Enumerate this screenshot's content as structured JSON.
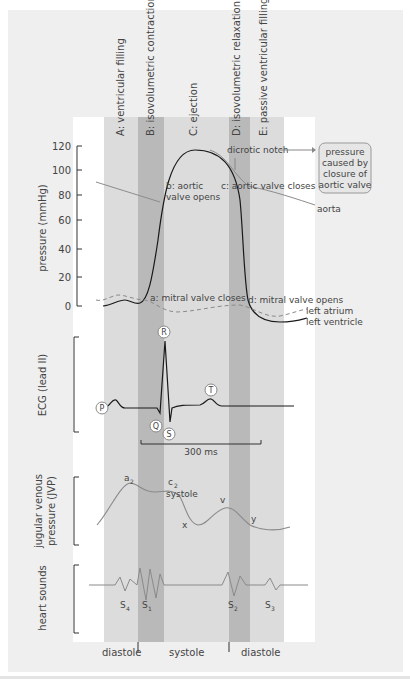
{
  "phases": [
    {
      "id": "A",
      "label": "A: ventricular filling"
    },
    {
      "id": "B",
      "label": "B: isovolumetric  contraction"
    },
    {
      "id": "C",
      "label": "C: ejection"
    },
    {
      "id": "D",
      "label": "D: isovolumetric relaxation"
    },
    {
      "id": "E",
      "label": "E: passive ventricular filling"
    }
  ],
  "pressure": {
    "ylabel": "pressure (mmHg)",
    "ticks": [
      "120",
      "100",
      "80",
      "60",
      "40",
      "20",
      "0"
    ],
    "annotations": {
      "dicrotic_notch": "dicrotic notch",
      "b_line1": "b: aortic",
      "b_line2": "valve opens",
      "c": "c: aortic valve closes",
      "a": "a: mitral valve closes",
      "d": "d: mitral valve opens",
      "aorta": "aorta",
      "left_atrium": "left atrium",
      "left_ventricle": "left ventricle"
    },
    "callout": {
      "line1": "pressure",
      "line2": "caused by",
      "line3": "closure of",
      "line4": "aortic valve"
    }
  },
  "ecg": {
    "ylabel": "ECG (lead II)",
    "waves": {
      "P": "P",
      "Q": "Q",
      "R": "R",
      "S": "S",
      "T": "T"
    },
    "scale": "300 ms"
  },
  "jvp": {
    "ylabel_line1": "jugular venous",
    "ylabel_line2": "pressure (JVP)",
    "points": {
      "a": "a",
      "a_sub": "2",
      "c": "c",
      "c_sub": "2",
      "systole": "systole",
      "x": "x",
      "v": "v",
      "y": "y"
    }
  },
  "sounds": {
    "ylabel": "heart sounds",
    "labels": [
      {
        "main": "S",
        "sub": "4"
      },
      {
        "main": "S",
        "sub": "1"
      },
      {
        "main": "S",
        "sub": "2"
      },
      {
        "main": "S",
        "sub": "3"
      }
    ]
  },
  "cycle": {
    "diastole_left": "diastole",
    "systole": "systole",
    "diastole_right": "diastole"
  },
  "colors": {
    "panel": "#efefef",
    "light_band": "#dcdcdc",
    "dark_band": "#b9b9b9",
    "ventricle_line": "#1a1a1a",
    "aorta_line": "#888888",
    "atrium_line": "#8a8a8a",
    "text": "#444444"
  }
}
